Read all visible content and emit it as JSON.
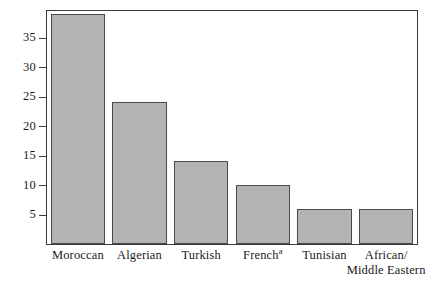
{
  "chart_data": {
    "type": "bar",
    "title": "",
    "subtitle": "",
    "xlabel": "",
    "ylabel": "",
    "categories": [
      "Moroccan",
      "Algerian",
      "Turkish",
      "French",
      "Tunisian",
      "African/\nMiddle Eastern"
    ],
    "category_labels": [
      {
        "line1": "Moroccan",
        "line2": "",
        "footnote": ""
      },
      {
        "line1": "Algerian",
        "line2": "",
        "footnote": ""
      },
      {
        "line1": "Turkish",
        "line2": "",
        "footnote": ""
      },
      {
        "line1": "French",
        "line2": "",
        "footnote": "a"
      },
      {
        "line1": "Tunisian",
        "line2": "",
        "footnote": ""
      },
      {
        "line1": "African/",
        "line2": "Middle Eastern",
        "footnote": ""
      }
    ],
    "values": [
      39,
      24,
      14,
      10,
      6,
      6
    ],
    "ylim": [
      0,
      39.5
    ],
    "yticks": [
      5,
      10,
      15,
      20,
      25,
      30,
      35
    ],
    "ytick_labels": [
      "5",
      "10",
      "15",
      "20",
      "25",
      "30",
      "35"
    ],
    "grid": false,
    "legend": "none",
    "bar_fill_color": "#b4b4b4",
    "bar_edge_color": "#4a4a4a",
    "axis_color": "#3a3a3a",
    "background_color": "#ffffff",
    "footnotes": [
      "a"
    ]
  }
}
